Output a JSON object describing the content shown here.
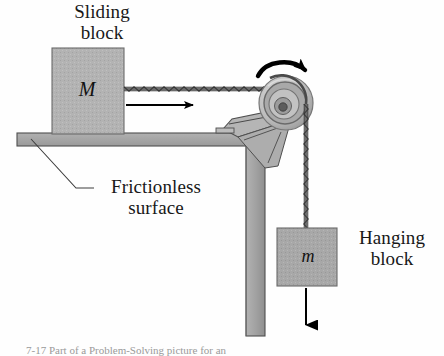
{
  "figure": {
    "caption": "7-17  Part of a Problem-Solving picture for an"
  },
  "labels": {
    "sliding_block": "Sliding\nblock",
    "frictionless_surface": "Frictionless\nsurface",
    "hanging_block": "Hanging\nblock"
  },
  "masses": {
    "sliding": "M",
    "hanging": "m"
  },
  "colors": {
    "block_fill": "#b3b3b3",
    "block_stroke": "#6f6f6f",
    "table_fill": "#a8a8a8",
    "table_stroke": "#4a4a4a",
    "pulley_outer": "#c9c9c9",
    "pulley_ring": "#8d8d8d",
    "pulley_inner": "#b8b8b8",
    "pulley_hub": "#5a5a5a",
    "bracket_fill": "#b5b5b5",
    "rope": "#555555",
    "arrow": "#000000",
    "leader": "#3d3d3d",
    "caption": "#9a9a9a"
  },
  "elements": {
    "sliding_block_mass_label": "M",
    "hanging_block_mass_label": "m",
    "motion_arrow_direction": "right",
    "rotation_arrow_direction": "clockwise",
    "weight_arrow_direction": "down"
  }
}
